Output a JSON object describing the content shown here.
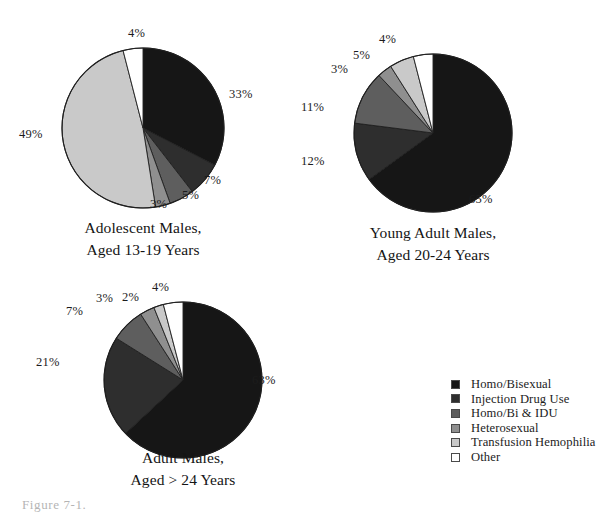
{
  "figure": {
    "background": "#ffffff",
    "bottom_caption": "Figure 7-1."
  },
  "legend": {
    "items": [
      {
        "label": "Homo/Bisexual",
        "color": "#161616",
        "key": "homo-bisexual"
      },
      {
        "label": "Injection Drug Use",
        "color": "#2e2e2e",
        "key": "injection-drug-use"
      },
      {
        "label": "Homo/Bi & IDU",
        "color": "#5e5e5e",
        "key": "homo-bi-and-idu"
      },
      {
        "label": "Heterosexual",
        "color": "#8f8f8f",
        "key": "heterosexual"
      },
      {
        "label": "Transfusion Hemophilia",
        "color": "#c9c9c9",
        "key": "transfusion-hemophilia"
      },
      {
        "label": "Other",
        "color": "#ffffff",
        "key": "other"
      }
    ]
  },
  "chart_data": [
    {
      "type": "pie",
      "id": "adolescent-males",
      "title": "Adolescent Males, Aged 13-19 Years",
      "title_lines": [
        "Adolescent Males,",
        "Aged 13-19 Years"
      ],
      "categories": [
        "Homo/Bisexual",
        "Injection Drug Use",
        "Homo/Bi & IDU",
        "Heterosexual",
        "Transfusion Hemophilia",
        "Other"
      ],
      "values": [
        33,
        7,
        5,
        3,
        49,
        4
      ],
      "labels": [
        "33%",
        "7%",
        "5%",
        "3%",
        "49%",
        "4%"
      ],
      "colors": [
        "#161616",
        "#2e2e2e",
        "#5e5e5e",
        "#8f8f8f",
        "#c9c9c9",
        "#ffffff"
      ],
      "start_angle": 0,
      "direction": "clockwise",
      "legend_position": "external-bottom-right"
    },
    {
      "type": "pie",
      "id": "young-adult-males",
      "title": "Young Adult Males, Aged 20-24 Years",
      "title_lines": [
        "Young Adult Males,",
        "Aged 20-24 Years"
      ],
      "categories": [
        "Homo/Bisexual",
        "Injection Drug Use",
        "Homo/Bi & IDU",
        "Heterosexual",
        "Transfusion Hemophilia",
        "Other"
      ],
      "values": [
        65,
        12,
        11,
        3,
        5,
        4
      ],
      "labels": [
        "65%",
        "12%",
        "11%",
        "3%",
        "5%",
        "4%"
      ],
      "colors": [
        "#161616",
        "#2e2e2e",
        "#5e5e5e",
        "#8f8f8f",
        "#c9c9c9",
        "#ffffff"
      ],
      "start_angle": 0,
      "direction": "clockwise",
      "legend_position": "external-bottom-right"
    },
    {
      "type": "pie",
      "id": "adult-males",
      "title": "Adult Males, Aged > 24 Years",
      "title_lines": [
        "Adult Males,",
        "Aged > 24 Years"
      ],
      "categories": [
        "Homo/Bisexual",
        "Injection Drug Use",
        "Homo/Bi & IDU",
        "Heterosexual",
        "Transfusion Hemophilia",
        "Other"
      ],
      "values": [
        63,
        21,
        7,
        3,
        2,
        4
      ],
      "labels": [
        "63%",
        "21%",
        "7%",
        "3%",
        "2%",
        "4%"
      ],
      "colors": [
        "#161616",
        "#2e2e2e",
        "#5e5e5e",
        "#8f8f8f",
        "#c9c9c9",
        "#ffffff"
      ],
      "start_angle": 0,
      "direction": "clockwise",
      "legend_position": "external-bottom-right"
    }
  ],
  "pies": {
    "adolescent": {
      "caption_line1": "Adolescent Males,",
      "caption_line2": "Aged 13-19 Years",
      "pct": {
        "p0": "33%",
        "p1": "7%",
        "p2": "5%",
        "p3": "3%",
        "p4": "49%",
        "p5": "4%"
      }
    },
    "young_adult": {
      "caption_line1": "Young Adult Males,",
      "caption_line2": "Aged 20-24 Years",
      "pct": {
        "p0": "65%",
        "p1": "12%",
        "p2": "11%",
        "p3": "3%",
        "p4": "5%",
        "p5": "4%"
      }
    },
    "adult": {
      "caption_line1": "Adult Males,",
      "caption_line2": "Aged > 24 Years",
      "pct": {
        "p0": "63%",
        "p1": "21%",
        "p2": "7%",
        "p3": "3%",
        "p4": "2%",
        "p5": "4%"
      }
    }
  }
}
